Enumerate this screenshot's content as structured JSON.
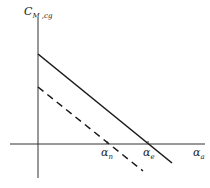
{
  "diagram": {
    "y_axis_label": {
      "main": "C",
      "sub": "M ,cg"
    },
    "x_axis_label": {
      "main": "α",
      "sub": "a"
    },
    "markers": [
      {
        "main": "α",
        "sub": "n"
      },
      {
        "main": "α",
        "sub": "e"
      }
    ],
    "lines": [
      {
        "style": "solid",
        "from": [
          38,
          54
        ],
        "to": [
          172,
          163
        ]
      },
      {
        "style": "dashed",
        "from": [
          38,
          87
        ],
        "to": [
          143,
          171
        ]
      }
    ],
    "colors": {
      "line": "#1a1a1a",
      "axis": "#333333"
    }
  }
}
